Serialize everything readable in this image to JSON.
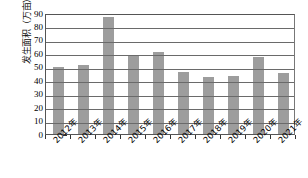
{
  "chart_data": {
    "type": "bar",
    "title": "",
    "xlabel": "",
    "ylabel": "发生面积（万亩）",
    "categories": [
      "2012年",
      "2013年",
      "2014年",
      "2015年",
      "2016年",
      "2017年",
      "2018年",
      "2019年",
      "2020年",
      "2021年"
    ],
    "values": [
      50,
      51.5,
      87,
      58,
      61,
      46,
      42.5,
      43.5,
      57,
      45.5
    ],
    "ylim": [
      0,
      90
    ],
    "ytick_values": [
      0,
      10,
      20,
      30,
      40,
      50,
      60,
      70,
      80,
      90
    ],
    "ytick_labels": [
      "0",
      "10",
      "20",
      "30",
      "40",
      "50",
      "60",
      "70",
      "80",
      "90"
    ],
    "grid": true,
    "legend": false,
    "series": [
      {
        "name": "发生面积",
        "values": [
          50,
          51.5,
          87,
          58,
          61,
          46,
          42.5,
          43.5,
          57,
          45.5
        ]
      }
    ],
    "bar_color": "#9d9d9d",
    "axis_color": "#555555",
    "grid_color": "#6a6a6a"
  }
}
